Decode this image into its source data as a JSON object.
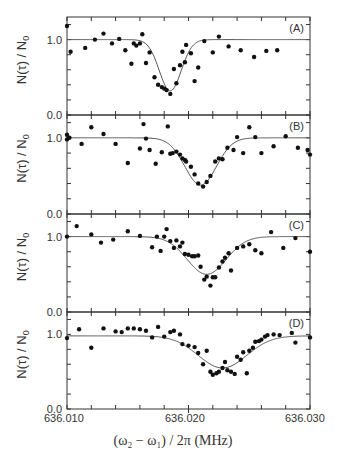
{
  "chart_data": [
    {
      "type": "scatter",
      "panel": "A",
      "xlabel": "(ω2 − ω1) / 2π (MHz)",
      "ylabel": "N(τ) / N0",
      "xlim": [
        636.01,
        636.03
      ],
      "ylim": [
        0.0,
        1.3
      ],
      "yticks": [
        "0.0",
        "1.0"
      ],
      "points": [
        [
          636.01,
          1.18
        ],
        [
          636.0103,
          0.84
        ],
        [
          636.0115,
          0.89
        ],
        [
          636.0123,
          1.0
        ],
        [
          636.013,
          1.08
        ],
        [
          636.0137,
          0.95
        ],
        [
          636.0143,
          1.01
        ],
        [
          636.0148,
          0.86
        ],
        [
          636.0153,
          0.68
        ],
        [
          636.0155,
          0.95
        ],
        [
          636.0157,
          0.92
        ],
        [
          636.016,
          0.95
        ],
        [
          636.0162,
          1.07
        ],
        [
          636.0165,
          0.69
        ],
        [
          636.0168,
          0.83
        ],
        [
          636.0172,
          0.5
        ],
        [
          636.0175,
          0.4
        ],
        [
          636.0178,
          0.37
        ],
        [
          636.018,
          0.35
        ],
        [
          636.0182,
          0.33
        ],
        [
          636.0185,
          0.28
        ],
        [
          636.0188,
          0.61
        ],
        [
          636.019,
          0.42
        ],
        [
          636.0193,
          0.66
        ],
        [
          636.0195,
          0.84
        ],
        [
          636.0197,
          0.7
        ],
        [
          636.0198,
          0.93
        ],
        [
          636.0202,
          0.82
        ],
        [
          636.0205,
          0.45
        ],
        [
          636.0208,
          0.63
        ],
        [
          636.0213,
          0.98
        ],
        [
          636.022,
          0.83
        ],
        [
          636.0225,
          1.04
        ],
        [
          636.0233,
          0.91
        ],
        [
          636.0243,
          0.86
        ],
        [
          636.0254,
          0.77
        ],
        [
          636.0264,
          0.85
        ],
        [
          636.0273,
          0.86
        ]
      ],
      "fit": {
        "center": 636.0185,
        "depth": 0.68,
        "width": 0.0009,
        "baseline": 1.0
      }
    },
    {
      "type": "scatter",
      "panel": "B",
      "xlim": [
        636.01,
        636.03
      ],
      "ylim": [
        0.0,
        1.3
      ],
      "points": [
        [
          636.01,
          1.04
        ],
        [
          636.01,
          0.98
        ],
        [
          636.0102,
          1.0
        ],
        [
          636.0112,
          0.92
        ],
        [
          636.012,
          1.14
        ],
        [
          636.013,
          1.05
        ],
        [
          636.014,
          0.92
        ],
        [
          636.015,
          0.67
        ],
        [
          636.016,
          0.86
        ],
        [
          636.0163,
          1.18
        ],
        [
          636.0165,
          0.99
        ],
        [
          636.0168,
          0.84
        ],
        [
          636.0173,
          0.66
        ],
        [
          636.0178,
          0.81
        ],
        [
          636.0183,
          1.15
        ],
        [
          636.0185,
          0.79
        ],
        [
          636.0187,
          0.8
        ],
        [
          636.019,
          0.82
        ],
        [
          636.0193,
          0.78
        ],
        [
          636.0195,
          0.73
        ],
        [
          636.0197,
          0.71
        ],
        [
          636.0198,
          0.69
        ],
        [
          636.0202,
          0.62
        ],
        [
          636.0205,
          0.52
        ],
        [
          636.0208,
          0.4
        ],
        [
          636.0212,
          0.36
        ],
        [
          636.0215,
          0.42
        ],
        [
          636.0218,
          0.5
        ],
        [
          636.0222,
          0.69
        ],
        [
          636.0225,
          0.73
        ],
        [
          636.0228,
          0.72
        ],
        [
          636.0232,
          0.87
        ],
        [
          636.0237,
          0.84
        ],
        [
          636.024,
          1.01
        ],
        [
          636.0245,
          0.8
        ],
        [
          636.025,
          1.14
        ],
        [
          636.0255,
          1.01
        ],
        [
          636.026,
          0.8
        ],
        [
          636.027,
          0.89
        ],
        [
          636.028,
          1.02
        ],
        [
          636.029,
          0.87
        ],
        [
          636.0298,
          0.84
        ],
        [
          636.03,
          0.78
        ]
      ],
      "fit": {
        "center": 636.021,
        "depth": 0.62,
        "width": 0.0013,
        "baseline": 1.0
      }
    },
    {
      "type": "scatter",
      "panel": "C",
      "xlim": [
        636.01,
        636.03
      ],
      "ylim": [
        0.0,
        1.3
      ],
      "points": [
        [
          636.01,
          1.0
        ],
        [
          636.0108,
          1.14
        ],
        [
          636.012,
          1.03
        ],
        [
          636.0128,
          0.92
        ],
        [
          636.0138,
          0.96
        ],
        [
          636.015,
          1.07
        ],
        [
          636.016,
          1.01
        ],
        [
          636.017,
          0.86
        ],
        [
          636.0174,
          1.0
        ],
        [
          636.0177,
          0.81
        ],
        [
          636.018,
          1.0
        ],
        [
          636.0182,
          1.1
        ],
        [
          636.0185,
          0.94
        ],
        [
          636.0188,
          0.85
        ],
        [
          636.019,
          0.95
        ],
        [
          636.0193,
          0.87
        ],
        [
          636.0195,
          0.92
        ],
        [
          636.0197,
          0.77
        ],
        [
          636.02,
          0.76
        ],
        [
          636.0203,
          0.74
        ],
        [
          636.0205,
          0.74
        ],
        [
          636.0208,
          0.75
        ],
        [
          636.021,
          0.6
        ],
        [
          636.0213,
          0.43
        ],
        [
          636.0215,
          0.47
        ],
        [
          636.0218,
          0.35
        ],
        [
          636.022,
          0.46
        ],
        [
          636.0222,
          0.46
        ],
        [
          636.0225,
          0.59
        ],
        [
          636.0228,
          0.67
        ],
        [
          636.023,
          0.72
        ],
        [
          636.0233,
          0.78
        ],
        [
          636.0235,
          0.55
        ],
        [
          636.024,
          0.85
        ],
        [
          636.0245,
          0.87
        ],
        [
          636.025,
          0.9
        ],
        [
          636.0255,
          0.82
        ],
        [
          636.026,
          0.78
        ],
        [
          636.0268,
          1.06
        ],
        [
          636.0278,
          0.85
        ],
        [
          636.0288,
          0.98
        ],
        [
          636.03,
          0.8
        ]
      ],
      "fit": {
        "center": 636.0215,
        "depth": 0.5,
        "width": 0.0016,
        "baseline": 1.0
      }
    },
    {
      "type": "scatter",
      "panel": "D",
      "xlabel": "(ω2 − ω1) / 2π (MHz)",
      "xticks": [
        "636.010",
        "636.020",
        "636.030"
      ],
      "xlim": [
        636.01,
        636.03
      ],
      "ylim": [
        0.0,
        1.3
      ],
      "points": [
        [
          636.01,
          0.95
        ],
        [
          636.011,
          1.07
        ],
        [
          636.012,
          0.82
        ],
        [
          636.013,
          1.08
        ],
        [
          636.014,
          1.04
        ],
        [
          636.0145,
          1.03
        ],
        [
          636.015,
          1.08
        ],
        [
          636.0155,
          1.08
        ],
        [
          636.016,
          1.07
        ],
        [
          636.0165,
          1.05
        ],
        [
          636.017,
          0.96
        ],
        [
          636.0175,
          1.1
        ],
        [
          636.018,
          0.97
        ],
        [
          636.0185,
          1.03
        ],
        [
          636.0188,
          1.05
        ],
        [
          636.0193,
          1.0
        ],
        [
          636.0195,
          0.87
        ],
        [
          636.02,
          0.85
        ],
        [
          636.0205,
          0.83
        ],
        [
          636.0208,
          0.75
        ],
        [
          636.0212,
          0.6
        ],
        [
          636.0215,
          0.78
        ],
        [
          636.0218,
          0.5
        ],
        [
          636.022,
          0.46
        ],
        [
          636.0223,
          0.48
        ],
        [
          636.0225,
          0.5
        ],
        [
          636.0228,
          0.55
        ],
        [
          636.023,
          0.63
        ],
        [
          636.0232,
          0.52
        ],
        [
          636.0235,
          0.5
        ],
        [
          636.0238,
          0.47
        ],
        [
          636.024,
          0.7
        ],
        [
          636.0243,
          0.66
        ],
        [
          636.0245,
          0.76
        ],
        [
          636.0248,
          0.48
        ],
        [
          636.025,
          0.78
        ],
        [
          636.0253,
          0.82
        ],
        [
          636.0255,
          0.9
        ],
        [
          636.0258,
          0.91
        ],
        [
          636.026,
          0.93
        ],
        [
          636.0263,
          0.97
        ],
        [
          636.0265,
          0.99
        ],
        [
          636.027,
          1.0
        ],
        [
          636.0275,
          0.99
        ],
        [
          636.0285,
          1.02
        ],
        [
          636.0288,
          0.89
        ],
        [
          636.03,
          0.96
        ]
      ],
      "fit": {
        "center": 636.0228,
        "depth": 0.43,
        "width": 0.002,
        "baseline": 0.98
      }
    }
  ],
  "figure": {
    "ylabel": "N(τ) / N",
    "ylabel_sub": "0",
    "y_tick_top": "1.0",
    "y_tick_bottom": "0.0",
    "panel_labels": [
      "(A)",
      "(B)",
      "(C)",
      "(D)"
    ],
    "xticks": [
      "636.010",
      "636.020",
      "636.030"
    ],
    "xlabel": "(ω₂ − ω₁) / 2π  (MHz)"
  }
}
